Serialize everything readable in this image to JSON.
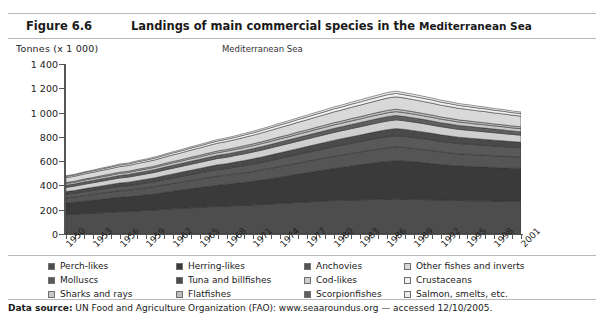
{
  "header": {
    "figure_number": "Figure 6.6",
    "title_main": "Landings of main commercial species in the ",
    "title_tail": "Mediterranean Sea"
  },
  "footer": {
    "label": "Data source:",
    "text": " UN Food and Agriculture Organization (FAO): www.seaaroundus.org — accessed 12/10/2005."
  },
  "legend": {
    "columns": [
      [
        {
          "label": "Perch-likes",
          "color": "#4d4d4d"
        },
        {
          "label": "Molluscs",
          "color": "#595959"
        },
        {
          "label": "Sharks and rays",
          "color": "#c8c8c8"
        }
      ],
      [
        {
          "label": "Herring-likes",
          "color": "#3a3a3a"
        },
        {
          "label": "Tuna and billfishes",
          "color": "#4a4a4a"
        },
        {
          "label": "Flatfishes",
          "color": "#bdbdbd"
        }
      ],
      [
        {
          "label": "Anchovies",
          "color": "#555555"
        },
        {
          "label": "Cod-likes",
          "color": "#cfcfcf"
        },
        {
          "label": "Scorpionfishes",
          "color": "#5f5f5f"
        }
      ],
      [
        {
          "label": "Other fishes and inverts",
          "color": "#d9d9d9"
        },
        {
          "label": "Crustaceans",
          "color": "#f2f2f2"
        },
        {
          "label": "Salmon, smelts, etc.",
          "color": "#ededed"
        }
      ]
    ]
  },
  "chart_data": {
    "type": "area",
    "title": "Mediterranean Sea",
    "ylabel": "Tonnes (x 1 000)",
    "xlabel": "",
    "ylim": [
      0,
      1400
    ],
    "yticks": [
      0,
      200,
      400,
      600,
      800,
      1000,
      1200,
      1400
    ],
    "ytick_labels": [
      "0",
      "200",
      "400",
      "600",
      "800",
      "1 000",
      "1 200",
      "1 400"
    ],
    "grid": false,
    "legend_position": "below",
    "x": [
      1950,
      1951,
      1952,
      1953,
      1954,
      1955,
      1956,
      1957,
      1958,
      1959,
      1960,
      1961,
      1962,
      1963,
      1964,
      1965,
      1966,
      1967,
      1968,
      1969,
      1970,
      1971,
      1972,
      1973,
      1974,
      1975,
      1976,
      1977,
      1978,
      1979,
      1980,
      1981,
      1982,
      1983,
      1984,
      1985,
      1986,
      1987,
      1988,
      1989,
      1990,
      1991,
      1992,
      1993,
      1994,
      1995,
      1996,
      1997,
      1998,
      1999,
      2000,
      2001
    ],
    "xtick_labels": [
      "1950",
      "1953",
      "1956",
      "1959",
      "1962",
      "1965",
      "1968",
      "1971",
      "1974",
      "1977",
      "1980",
      "1983",
      "1986",
      "1989",
      "1992",
      "1995",
      "1998",
      "2001"
    ],
    "xtick_step_years": 3,
    "stack_order_bottom_to_top": [
      "Perch-likes",
      "Herring-likes",
      "Anchovies",
      "Molluscs",
      "Tuna and billfishes",
      "Cod-likes",
      "Scorpionfishes",
      "Sharks and rays",
      "Flatfishes",
      "Other fishes and inverts",
      "Crustaceans",
      "Salmon, smelts, etc."
    ],
    "series": [
      {
        "name": "Perch-likes",
        "color": "#4d4d4d",
        "values": [
          160,
          163,
          168,
          172,
          176,
          180,
          184,
          186,
          190,
          194,
          198,
          204,
          208,
          212,
          216,
          220,
          224,
          228,
          230,
          233,
          236,
          240,
          244,
          248,
          252,
          256,
          260,
          264,
          268,
          272,
          276,
          278,
          280,
          282,
          284,
          286,
          288,
          290,
          288,
          286,
          284,
          282,
          280,
          278,
          276,
          275,
          274,
          273,
          272,
          271,
          270,
          270
        ]
      },
      {
        "name": "Herring-likes",
        "color": "#3a3a3a",
        "values": [
          95,
          98,
          102,
          106,
          110,
          114,
          118,
          120,
          124,
          128,
          132,
          138,
          144,
          150,
          156,
          162,
          168,
          174,
          178,
          184,
          188,
          194,
          200,
          208,
          216,
          224,
          232,
          240,
          248,
          256,
          264,
          272,
          280,
          288,
          296,
          304,
          310,
          314,
          312,
          308,
          304,
          298,
          292,
          288,
          284,
          282,
          280,
          278,
          276,
          274,
          272,
          270
        ]
      },
      {
        "name": "Anchovies",
        "color": "#555555",
        "values": [
          42,
          44,
          46,
          48,
          50,
          52,
          54,
          55,
          57,
          59,
          61,
          63,
          65,
          67,
          69,
          71,
          73,
          75,
          76,
          78,
          80,
          82,
          84,
          86,
          88,
          90,
          92,
          94,
          96,
          98,
          100,
          102,
          104,
          106,
          108,
          110,
          112,
          113,
          112,
          110,
          108,
          106,
          104,
          102,
          100,
          99,
          98,
          97,
          96,
          95,
          94,
          93
        ]
      },
      {
        "name": "Molluscs",
        "color": "#595959",
        "values": [
          30,
          31,
          32,
          33,
          34,
          35,
          36,
          37,
          38,
          39,
          40,
          42,
          44,
          46,
          48,
          50,
          52,
          54,
          55,
          57,
          59,
          61,
          63,
          65,
          67,
          69,
          71,
          73,
          75,
          77,
          79,
          81,
          83,
          85,
          87,
          89,
          91,
          92,
          91,
          90,
          89,
          88,
          87,
          86,
          85,
          84,
          83,
          82,
          81,
          80,
          79,
          78
        ]
      },
      {
        "name": "Tuna and billfishes",
        "color": "#4a4a4a",
        "values": [
          22,
          23,
          24,
          25,
          26,
          27,
          28,
          29,
          30,
          31,
          32,
          33,
          34,
          35,
          36,
          37,
          38,
          39,
          40,
          41,
          42,
          43,
          44,
          45,
          46,
          47,
          48,
          49,
          50,
          51,
          52,
          53,
          54,
          55,
          56,
          57,
          58,
          59,
          58,
          57,
          56,
          55,
          54,
          53,
          52,
          51,
          50,
          49,
          48,
          47,
          46,
          45
        ]
      },
      {
        "name": "Cod-likes",
        "color": "#cfcfcf",
        "values": [
          35,
          36,
          37,
          38,
          39,
          40,
          41,
          42,
          43,
          44,
          45,
          46,
          47,
          48,
          49,
          50,
          51,
          52,
          53,
          54,
          55,
          56,
          57,
          58,
          59,
          60,
          61,
          62,
          63,
          64,
          65,
          66,
          67,
          68,
          69,
          70,
          71,
          72,
          71,
          70,
          69,
          68,
          67,
          66,
          65,
          64,
          63,
          62,
          61,
          60,
          59,
          58
        ]
      },
      {
        "name": "Scorpionfishes",
        "color": "#5f5f5f",
        "values": [
          18,
          18,
          19,
          19,
          20,
          20,
          21,
          21,
          22,
          22,
          23,
          23,
          24,
          24,
          25,
          25,
          26,
          26,
          27,
          27,
          28,
          28,
          29,
          29,
          30,
          30,
          31,
          31,
          32,
          32,
          33,
          33,
          34,
          34,
          35,
          35,
          36,
          36,
          35,
          35,
          34,
          34,
          33,
          33,
          32,
          32,
          31,
          31,
          30,
          30,
          29,
          29
        ]
      },
      {
        "name": "Sharks and rays",
        "color": "#c8c8c8",
        "values": [
          14,
          14,
          15,
          15,
          16,
          16,
          17,
          17,
          18,
          18,
          19,
          19,
          20,
          20,
          21,
          21,
          22,
          22,
          23,
          23,
          24,
          24,
          25,
          25,
          26,
          26,
          27,
          27,
          28,
          28,
          29,
          29,
          30,
          30,
          31,
          31,
          32,
          32,
          31,
          31,
          30,
          30,
          29,
          29,
          28,
          28,
          27,
          27,
          26,
          26,
          25,
          25
        ]
      },
      {
        "name": "Flatfishes",
        "color": "#bdbdbd",
        "values": [
          8,
          8,
          9,
          9,
          9,
          10,
          10,
          10,
          11,
          11,
          11,
          12,
          12,
          12,
          13,
          13,
          13,
          14,
          14,
          14,
          15,
          15,
          15,
          16,
          16,
          16,
          17,
          17,
          17,
          18,
          18,
          18,
          19,
          19,
          19,
          20,
          20,
          20,
          20,
          19,
          19,
          19,
          18,
          18,
          18,
          17,
          17,
          17,
          16,
          16,
          16,
          15
        ]
      },
      {
        "name": "Other fishes and inverts",
        "color": "#d9d9d9",
        "values": [
          40,
          41,
          42,
          43,
          44,
          45,
          46,
          47,
          48,
          49,
          50,
          52,
          54,
          56,
          58,
          60,
          62,
          64,
          65,
          67,
          69,
          71,
          73,
          75,
          77,
          79,
          81,
          83,
          85,
          87,
          89,
          91,
          93,
          95,
          97,
          99,
          101,
          102,
          101,
          100,
          99,
          98,
          97,
          96,
          95,
          94,
          93,
          92,
          91,
          90,
          89,
          88
        ]
      },
      {
        "name": "Crustaceans",
        "color": "#f2f2f2",
        "values": [
          10,
          10,
          11,
          11,
          12,
          12,
          13,
          13,
          14,
          14,
          15,
          15,
          16,
          16,
          17,
          17,
          18,
          18,
          19,
          19,
          20,
          20,
          21,
          21,
          22,
          22,
          23,
          23,
          24,
          24,
          25,
          25,
          26,
          26,
          27,
          27,
          28,
          28,
          27,
          27,
          26,
          26,
          25,
          25,
          24,
          24,
          23,
          23,
          22,
          22,
          21,
          21
        ]
      },
      {
        "name": "Salmon, smelts, etc.",
        "color": "#ededed",
        "values": [
          6,
          6,
          6,
          7,
          7,
          7,
          8,
          8,
          8,
          9,
          9,
          9,
          10,
          10,
          10,
          11,
          11,
          11,
          12,
          12,
          12,
          13,
          13,
          13,
          14,
          14,
          14,
          15,
          15,
          15,
          16,
          16,
          16,
          17,
          17,
          17,
          18,
          18,
          17,
          17,
          17,
          16,
          16,
          16,
          15,
          15,
          15,
          14,
          14,
          14,
          13,
          13
        ]
      }
    ]
  }
}
